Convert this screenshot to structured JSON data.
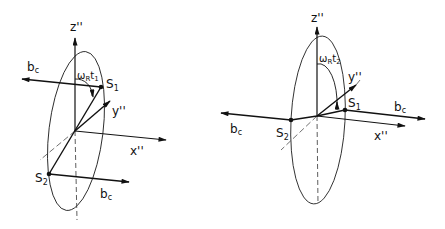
{
  "figure": {
    "left": {
      "axes": {
        "z": "z''",
        "y": "y''",
        "x": "x''"
      },
      "points": {
        "s1": "S",
        "s1_sub": "1",
        "s2": "S",
        "s2_sub": "2"
      },
      "vectors": {
        "top": "b",
        "top_sub": "c",
        "bottom": "b",
        "bottom_sub": "c"
      },
      "angle": {
        "omega": "ω",
        "omega_sub": "R",
        "t": "t",
        "t_sub": "1"
      }
    },
    "right": {
      "axes": {
        "z": "z''",
        "y": "y''",
        "x": "x''"
      },
      "points": {
        "s1": "S",
        "s1_sub": "1",
        "s2": "S",
        "s2_sub": "2"
      },
      "vectors": {
        "left": "b",
        "left_sub": "c",
        "right": "b",
        "right_sub": "c"
      },
      "angle": {
        "omega": "ω",
        "omega_sub": "R",
        "t": "t",
        "t_sub": "2"
      }
    }
  }
}
